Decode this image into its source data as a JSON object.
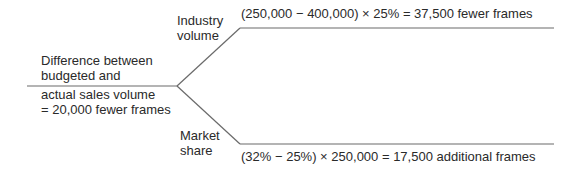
{
  "diagram": {
    "root": {
      "line1": "Difference between",
      "line2": "budgeted and",
      "line3": "actual sales volume",
      "line4": "= 20,000 fewer frames"
    },
    "branches": [
      {
        "label_line1": "Industry",
        "label_line2": "volume",
        "formula": "(250,000 − 400,000) × 25% = 37,500 fewer frames"
      },
      {
        "label_line1": "Market",
        "label_line2": "share",
        "formula": "(32% − 25%) × 250,000 = 17,500 additional frames"
      }
    ],
    "line_color": "#6a6a6a"
  }
}
